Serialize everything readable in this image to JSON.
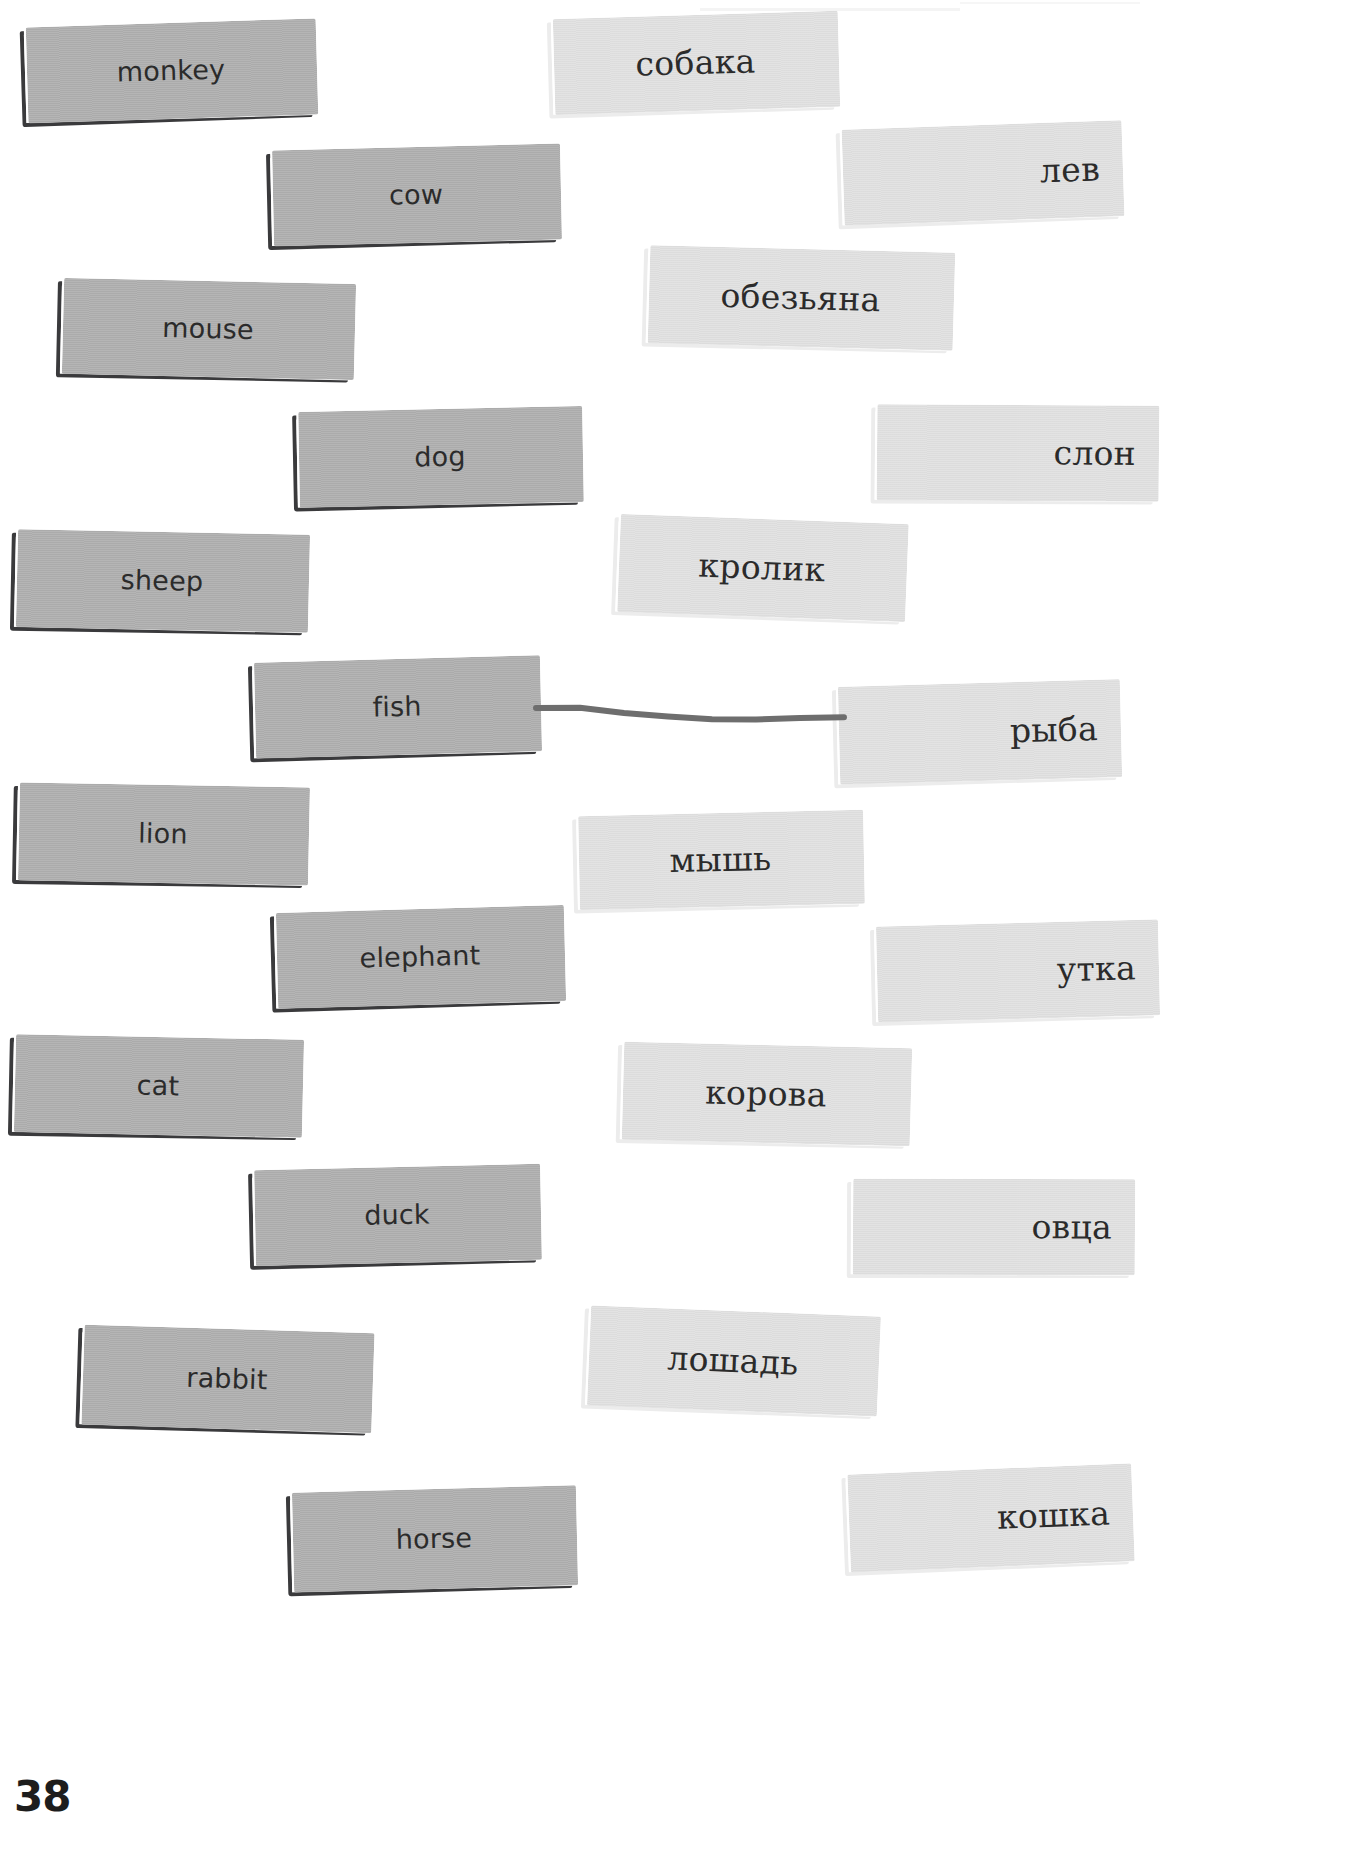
{
  "page": {
    "number": "38",
    "width": 1367,
    "height": 1851,
    "background_color": "#ffffff"
  },
  "colors": {
    "source_card_fill": "#adadad",
    "source_card_border": "#3a3a3c",
    "target_card_fill": "#dedede",
    "target_card_border": "#ececec",
    "text": "#2b2b2b",
    "connector_line": "#6e6e6e",
    "page_number": "#1d1d1d"
  },
  "exercise": {
    "type": "match-the-pairs",
    "source_language": "English",
    "target_language": "Russian",
    "source_cards": [
      {
        "id": "monkey",
        "label": "monkey",
        "x": 26,
        "y": 22,
        "w": 290,
        "h": 96,
        "rotate": -1.6,
        "align": "center"
      },
      {
        "id": "cow",
        "label": "cow",
        "x": 272,
        "y": 146,
        "w": 288,
        "h": 96,
        "rotate": -1.2,
        "align": "center"
      },
      {
        "id": "mouse",
        "label": "mouse",
        "x": 62,
        "y": 280,
        "w": 292,
        "h": 96,
        "rotate": 1.4,
        "align": "center"
      },
      {
        "id": "dog",
        "label": "dog",
        "x": 298,
        "y": 408,
        "w": 284,
        "h": 96,
        "rotate": -1.0,
        "align": "center"
      },
      {
        "id": "sheep",
        "label": "sheep",
        "x": 16,
        "y": 531,
        "w": 292,
        "h": 98,
        "rotate": 1.3,
        "align": "center"
      },
      {
        "id": "fish",
        "label": "fish",
        "x": 254,
        "y": 658,
        "w": 286,
        "h": 96,
        "rotate": -1.3,
        "align": "center"
      },
      {
        "id": "lion",
        "label": "lion",
        "x": 18,
        "y": 784,
        "w": 290,
        "h": 98,
        "rotate": 1.2,
        "align": "center"
      },
      {
        "id": "elephant",
        "label": "elephant",
        "x": 276,
        "y": 908,
        "w": 288,
        "h": 96,
        "rotate": -1.4,
        "align": "center"
      },
      {
        "id": "cat",
        "label": "cat",
        "x": 14,
        "y": 1036,
        "w": 288,
        "h": 98,
        "rotate": 1.3,
        "align": "center"
      },
      {
        "id": "duck",
        "label": "duck",
        "x": 254,
        "y": 1166,
        "w": 286,
        "h": 96,
        "rotate": -1.1,
        "align": "center"
      },
      {
        "id": "rabbit",
        "label": "rabbit",
        "x": 82,
        "y": 1328,
        "w": 290,
        "h": 100,
        "rotate": 1.9,
        "align": "center"
      },
      {
        "id": "horse",
        "label": "horse",
        "x": 292,
        "y": 1488,
        "w": 284,
        "h": 100,
        "rotate": -1.3,
        "align": "center"
      }
    ],
    "target_cards": [
      {
        "id": "sobaka",
        "label": "собака",
        "x": 553,
        "y": 14,
        "w": 285,
        "h": 96,
        "rotate": -1.5,
        "align": "center"
      },
      {
        "id": "lev",
        "label": "лев",
        "x": 842,
        "y": 124,
        "w": 280,
        "h": 96,
        "rotate": -1.8,
        "align": "right"
      },
      {
        "id": "obezyana",
        "label": "обезьяна",
        "x": 648,
        "y": 248,
        "w": 305,
        "h": 98,
        "rotate": 1.6,
        "align": "center"
      },
      {
        "id": "slon",
        "label": "слон",
        "x": 876,
        "y": 404,
        "w": 282,
        "h": 96,
        "rotate": 0.5,
        "align": "right"
      },
      {
        "id": "krolik",
        "label": "кролик",
        "x": 618,
        "y": 518,
        "w": 288,
        "h": 98,
        "rotate": 2.2,
        "align": "center"
      },
      {
        "id": "ryba",
        "label": "рыба",
        "x": 838,
        "y": 682,
        "w": 282,
        "h": 98,
        "rotate": -1.4,
        "align": "right"
      },
      {
        "id": "mysh",
        "label": "мышь",
        "x": 578,
        "y": 812,
        "w": 285,
        "h": 94,
        "rotate": -1.1,
        "align": "center"
      },
      {
        "id": "utka",
        "label": "утка",
        "x": 876,
        "y": 922,
        "w": 282,
        "h": 96,
        "rotate": -1.3,
        "align": "right"
      },
      {
        "id": "korova",
        "label": "корова",
        "x": 622,
        "y": 1044,
        "w": 288,
        "h": 98,
        "rotate": 1.5,
        "align": "center"
      },
      {
        "id": "ovtsa",
        "label": "овца",
        "x": 852,
        "y": 1178,
        "w": 282,
        "h": 96,
        "rotate": 0.3,
        "align": "right"
      },
      {
        "id": "loshad",
        "label": "лошадь",
        "x": 588,
        "y": 1310,
        "w": 290,
        "h": 100,
        "rotate": 2.4,
        "align": "center"
      },
      {
        "id": "koshka",
        "label": "кошка",
        "x": 848,
        "y": 1468,
        "w": 284,
        "h": 98,
        "rotate": -2.1,
        "align": "right"
      }
    ],
    "connections": [
      {
        "from": "fish",
        "to": "ryba",
        "stroke_color": "#6e6e6e",
        "stroke_width": 6
      }
    ]
  }
}
